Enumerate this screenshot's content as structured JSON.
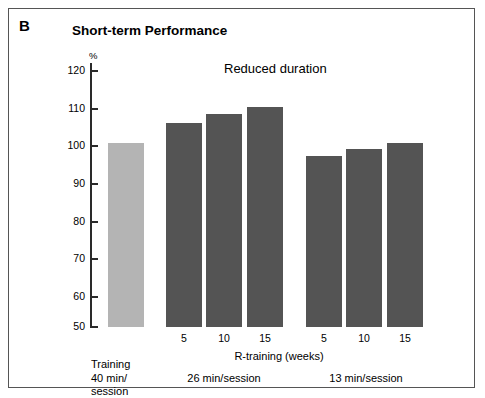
{
  "panel": {
    "letter": "B",
    "title": "Short-term Performance"
  },
  "annotations": {
    "reduced_duration": "Reduced duration"
  },
  "axes": {
    "y_unit": "%",
    "y_ticks": [
      "120",
      "110",
      "100",
      "90",
      "80",
      "70",
      "60",
      "50"
    ],
    "x_title": "R-training (weeks)"
  },
  "groups": {
    "training_caption_line1": "Training",
    "training_caption_line2": "40 min/",
    "training_caption_line3": "session",
    "group1_caption": "26 min/session",
    "group2_caption": "13 min/session"
  },
  "colors": {
    "baseline_bar": "#b4b4b4",
    "reduced_bar": "#545454",
    "axis": "#2a2a2a",
    "frame": "#555555",
    "background": "#ffffff"
  },
  "chart_data": {
    "type": "bar",
    "title": "Short-term Performance",
    "xlabel": "R-training (weeks)",
    "ylabel": "%",
    "ylim": [
      50,
      120
    ],
    "yticks": [
      50,
      60,
      70,
      80,
      90,
      100,
      110,
      120
    ],
    "grid": false,
    "legend": "none",
    "categories": [
      "Training",
      "5",
      "10",
      "15",
      "5",
      "10",
      "15"
    ],
    "values": [
      100,
      105.5,
      108,
      110,
      96.5,
      98.5,
      100
    ],
    "bar_colors": [
      "#b4b4b4",
      "#545454",
      "#545454",
      "#545454",
      "#545454",
      "#545454",
      "#545454"
    ],
    "group_labels": [
      "Training 40 min/session",
      "26 min/session",
      "13 min/session"
    ],
    "group_membership": [
      0,
      1,
      1,
      1,
      2,
      2,
      2
    ],
    "annotations": [
      "Reduced duration"
    ]
  }
}
